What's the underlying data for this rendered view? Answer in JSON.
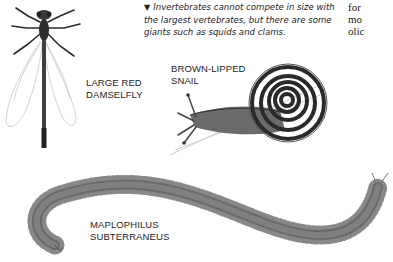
{
  "caption": {
    "marker": "▼",
    "text": "Invertebrates cannot compete in size with the largest vertebrates, but there are some giants such as squids and clams."
  },
  "body_text_fragment": {
    "lines": [
      "for",
      "mo",
      "olic"
    ]
  },
  "illustrations": [
    {
      "id": "damselfly",
      "label_lines": [
        "LARGE RED",
        "DAMSELFLY"
      ]
    },
    {
      "id": "snail",
      "label_lines": [
        "BROWN-LIPPED",
        "SNAIL"
      ]
    },
    {
      "id": "centipede",
      "label_lines": [
        "MAPLOPHILUS",
        "SUBTERRANEUS"
      ]
    }
  ],
  "colors": {
    "background": "#ffffff",
    "text": "#1e1e1e",
    "illustration_dark": "#2a2a2a",
    "illustration_light": "#c8c8c8"
  }
}
